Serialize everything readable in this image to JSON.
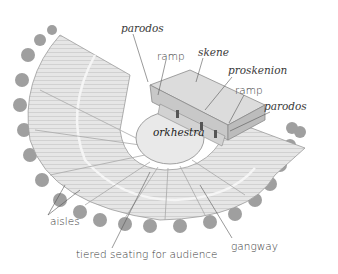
{
  "diagram": {
    "labels": {
      "parodos_left": "parodos",
      "ramp_left": "ramp",
      "skene": "skene",
      "proskenion": "proskenion",
      "ramp_right": "ramp",
      "parodos_right": "parodos",
      "orkhestra": "orkhestra",
      "aisles": "aisles",
      "seating": "tiered seating for audience",
      "gangway": "gangway"
    },
    "colors": {
      "background": "#ffffff",
      "label_text": "#3a3a3a",
      "leader_line": "#555555",
      "stone": "#d9d9d9",
      "trees": "#8c8c8c"
    }
  }
}
